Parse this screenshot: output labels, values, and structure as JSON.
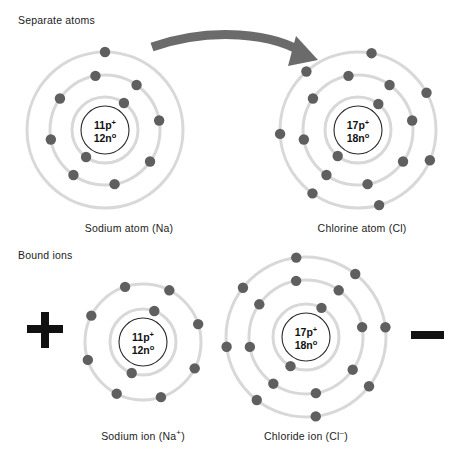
{
  "figure": {
    "title_top": "Separate atoms",
    "title_bottom": "Bound ions",
    "charge_plus": "+",
    "charge_minus": "–",
    "arrow": "electron-transfer-arrow"
  },
  "atoms": {
    "sodium_atom": {
      "caption": "Sodium atom (Na)",
      "protons": "11p",
      "protons_sign": "+",
      "neutrons": "12n",
      "neutrons_sign": "o",
      "cx": 105,
      "cy": 130,
      "shell_radii": [
        33,
        55,
        78
      ],
      "shell_electrons": [
        2,
        8,
        1
      ],
      "shell_start_angles": [
        -55,
        -100,
        -90
      ]
    },
    "chlorine_atom": {
      "caption": "Chlorine atom (Cl)",
      "protons": "17p",
      "protons_sign": "+",
      "neutrons": "18n",
      "neutrons_sign": "o",
      "cx": 358,
      "cy": 130,
      "shell_radii": [
        33,
        55,
        78
      ],
      "shell_electrons": [
        2,
        8,
        7
      ],
      "shell_start_angles": [
        -52,
        -100,
        -80
      ]
    },
    "sodium_ion": {
      "caption": "Sodium ion (Na",
      "caption_sup": "+",
      "caption_end": ")",
      "protons": "11p",
      "protons_sign": "+",
      "neutrons": "12n",
      "neutrons_sign": "o",
      "cx": 143,
      "cy": 342,
      "shell_radii": [
        33,
        58
      ],
      "shell_electrons": [
        2,
        8
      ],
      "shell_start_angles": [
        -70,
        -108
      ]
    },
    "chloride_ion": {
      "caption": "Chloride ion (Cl",
      "caption_sup": "–",
      "caption_end": ")",
      "protons": "17p",
      "protons_sign": "+",
      "neutrons": "18n",
      "neutrons_sign": "o",
      "cx": 306,
      "cy": 337,
      "shell_radii": [
        33,
        57,
        80
      ],
      "shell_electrons": [
        2,
        8,
        8
      ],
      "shell_start_angles": [
        -62,
        -100,
        -97
      ]
    }
  },
  "captions": {
    "sodium_atom_x": 129,
    "sodium_atom_y": 222,
    "chlorine_atom_x": 362,
    "chlorine_atom_y": 222,
    "sodium_ion_x": 143,
    "sodium_ion_y": 428,
    "chloride_ion_x": 306,
    "chloride_ion_y": 428
  },
  "style": {
    "shell_color": "#d8d8d8",
    "electron_color": "#5f5f5f",
    "nucleus_stroke": "#2b2b2b",
    "arrow_color": "#6b6b6b",
    "electron_radius": 5.2,
    "nucleus_radius": 24,
    "shell_width": 3
  },
  "chart_data": {
    "type": "diagram",
    "sections": [
      {
        "name": "Separate atoms",
        "items": [
          {
            "label": "Sodium atom (Na)",
            "protons": 11,
            "neutrons": 12,
            "electron_shells": [
              2,
              8,
              1
            ],
            "charge": 0
          },
          {
            "label": "Chlorine atom (Cl)",
            "protons": 17,
            "neutrons": 18,
            "electron_shells": [
              2,
              8,
              7
            ],
            "charge": 0
          }
        ],
        "annotation": "curved arrow from sodium outer shell to chlorine outer shell (electron transfer)"
      },
      {
        "name": "Bound ions",
        "items": [
          {
            "label": "Sodium ion (Na+)",
            "protons": 11,
            "neutrons": 12,
            "electron_shells": [
              2,
              8
            ],
            "charge": 1
          },
          {
            "label": "Chloride ion (Cl-)",
            "protons": 17,
            "neutrons": 18,
            "electron_shells": [
              2,
              8,
              8
            ],
            "charge": -1
          }
        ]
      }
    ]
  }
}
